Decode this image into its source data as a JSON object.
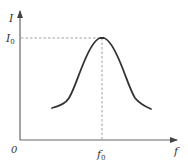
{
  "diagram": {
    "type": "resonance-curve",
    "y_axis": {
      "label": "I"
    },
    "x_axis": {
      "label": "f"
    },
    "origin_label": "0",
    "peak": {
      "y_label": "I",
      "y_label_sub": "0",
      "x_label": "f",
      "x_label_sub": "0"
    },
    "colors": {
      "axis": "#555555",
      "curve": "#333333",
      "dashed": "#888888",
      "text": "#333333"
    }
  }
}
